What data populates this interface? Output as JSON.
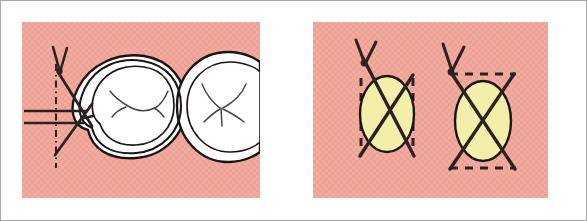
{
  "figure": {
    "kind": "dental-suture-illustration",
    "title": "",
    "frame_border_color": "#a9a9a9",
    "page_background": "#ffffff"
  },
  "panels": [
    {
      "id": "left",
      "name": "occlusal-molars-with-suture",
      "background_color": "#f3aca0",
      "x": 21,
      "y": 21,
      "width": 238,
      "height": 176,
      "elements": {
        "tooth_outline_color": "#1a1512",
        "tooth_fill_color": "#ffffff",
        "fissure_line_color": "#4a4340",
        "suture_color": "#2b2220",
        "reference_line_color": "#2b2220",
        "teeth": [
          {
            "name": "first-molar-outer-contour"
          },
          {
            "name": "first-molar-crown-outline"
          },
          {
            "name": "second-molar-crown-outline"
          }
        ],
        "lines": [
          {
            "name": "horizontal-reference-line-upper",
            "style": "solid"
          },
          {
            "name": "horizontal-reference-line-lower",
            "style": "solid"
          },
          {
            "name": "vertical-reference-line",
            "style": "dash-dot"
          },
          {
            "name": "suture-strand-descending",
            "style": "solid"
          },
          {
            "name": "suture-strand-ascending",
            "style": "solid"
          },
          {
            "name": "suture-knot-tails",
            "style": "solid"
          }
        ]
      }
    },
    {
      "id": "right",
      "name": "suture-crossing-diagrams",
      "background_color": "#f3aca0",
      "x": 312,
      "y": 21,
      "width": 235,
      "height": 176,
      "diagrams": [
        {
          "id": "left-ellipse",
          "name": "vertical-tangent-suture-diagram",
          "ellipse_fill_color": "#f3efaa",
          "ellipse_stroke_color": "#1a1512",
          "dashed_guide_orientation": "vertical",
          "dashed_guide_count": 2,
          "suture_crossing": "X",
          "knot_position": "top-left"
        },
        {
          "id": "right-ellipse",
          "name": "horizontal-tangent-suture-diagram",
          "ellipse_fill_color": "#f3efaa",
          "ellipse_stroke_color": "#1a1512",
          "dashed_guide_orientation": "horizontal",
          "dashed_guide_count": 2,
          "suture_crossing": "X",
          "knot_position": "top-left"
        }
      ]
    }
  ],
  "palette": {
    "pink_tissue": "#f3aca0",
    "pink_tissue_shade": "#eda195",
    "yellow_bone": "#f3efaa",
    "ink_dark": "#1a1512",
    "ink_medium": "#4a4340",
    "white": "#ffffff",
    "frame_gray": "#a9a9a9"
  }
}
